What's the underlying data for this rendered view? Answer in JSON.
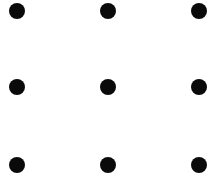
{
  "diagram": {
    "type": "dot-grid",
    "rows": 3,
    "cols": 3,
    "dot_color": "#0a0a0a",
    "background": "#ffffff",
    "dot_diameter": 16,
    "dots": [
      {
        "row": 0,
        "col": 0,
        "cx": 17,
        "cy": 11
      },
      {
        "row": 0,
        "col": 1,
        "cx": 108,
        "cy": 11
      },
      {
        "row": 0,
        "col": 2,
        "cx": 199,
        "cy": 11
      },
      {
        "row": 1,
        "col": 0,
        "cx": 17,
        "cy": 87
      },
      {
        "row": 1,
        "col": 1,
        "cx": 108,
        "cy": 87
      },
      {
        "row": 1,
        "col": 2,
        "cx": 199,
        "cy": 87
      },
      {
        "row": 2,
        "col": 0,
        "cx": 17,
        "cy": 165
      },
      {
        "row": 2,
        "col": 1,
        "cx": 108,
        "cy": 165
      },
      {
        "row": 2,
        "col": 2,
        "cx": 199,
        "cy": 165
      }
    ]
  }
}
